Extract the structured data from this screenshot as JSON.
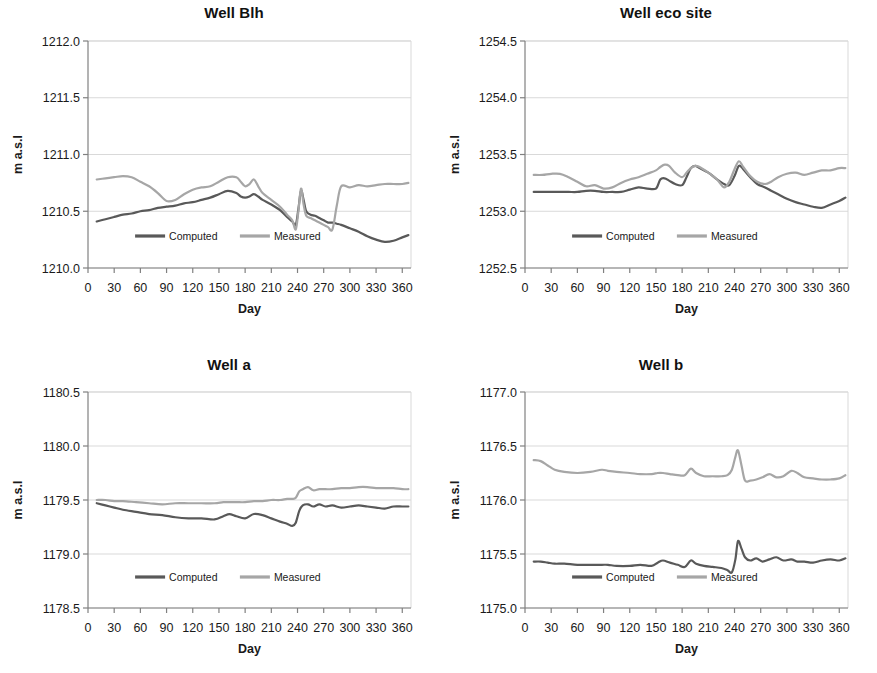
{
  "figure": {
    "panel_count": 4,
    "layout": "2x2"
  },
  "colors": {
    "computed": "#595959",
    "measured": "#a6a6a6",
    "axis": "#808080",
    "gridline": "#d9d9d9",
    "text": "#1a1a1a",
    "background": "#ffffff"
  },
  "common": {
    "xlabel": "Day",
    "ylabel": "m  a.s.l",
    "xticks": [
      "0",
      "30",
      "60",
      "90",
      "120",
      "150",
      "180",
      "210",
      "240",
      "270",
      "300",
      "330",
      "360"
    ],
    "legend": [
      {
        "label": "Computed",
        "color": "#595959"
      },
      {
        "label": "Measured",
        "color": "#a6a6a6"
      }
    ],
    "legend_position": "inside-bottom-center"
  },
  "chart_data": [
    {
      "id": "well-blh",
      "type": "line",
      "title": "Well Blh",
      "xlabel": "Day",
      "ylabel": "m  a.s.l",
      "xlim": [
        0,
        370
      ],
      "ylim": [
        1210.0,
        1212.0
      ],
      "yticks": [
        "1210.0",
        "1210.5",
        "1211.0",
        "1211.5",
        "1212.0"
      ],
      "ytick_values": [
        1210.0,
        1210.5,
        1211.0,
        1211.5,
        1212.0
      ],
      "xticks": [
        "0",
        "30",
        "60",
        "90",
        "120",
        "150",
        "180",
        "210",
        "240",
        "270",
        "300",
        "330",
        "360"
      ],
      "grid": true,
      "x": [
        10,
        20,
        30,
        40,
        50,
        60,
        70,
        80,
        90,
        100,
        110,
        120,
        130,
        140,
        150,
        160,
        170,
        175,
        180,
        185,
        190,
        195,
        200,
        210,
        220,
        228,
        234,
        238,
        241,
        244,
        247,
        250,
        255,
        260,
        265,
        270,
        275,
        280,
        285,
        290,
        300,
        310,
        320,
        330,
        340,
        350,
        360,
        367
      ],
      "series": [
        {
          "name": "Computed",
          "color": "#595959",
          "values": [
            1210.41,
            1210.43,
            1210.45,
            1210.47,
            1210.48,
            1210.5,
            1210.51,
            1210.53,
            1210.54,
            1210.55,
            1210.57,
            1210.58,
            1210.6,
            1210.62,
            1210.65,
            1210.68,
            1210.66,
            1210.63,
            1210.62,
            1210.63,
            1210.65,
            1210.63,
            1210.6,
            1210.56,
            1210.51,
            1210.45,
            1210.41,
            1210.38,
            1210.52,
            1210.68,
            1210.6,
            1210.5,
            1210.47,
            1210.46,
            1210.44,
            1210.42,
            1210.4,
            1210.4,
            1210.39,
            1210.38,
            1210.35,
            1210.32,
            1210.28,
            1210.25,
            1210.23,
            1210.24,
            1210.27,
            1210.29
          ]
        },
        {
          "name": "Measured",
          "color": "#a6a6a6",
          "values": [
            1210.78,
            1210.79,
            1210.8,
            1210.81,
            1210.8,
            1210.76,
            1210.72,
            1210.66,
            1210.59,
            1210.6,
            1210.65,
            1210.69,
            1210.71,
            1210.72,
            1210.76,
            1210.8,
            1210.8,
            1210.76,
            1210.72,
            1210.74,
            1210.78,
            1210.72,
            1210.66,
            1210.6,
            1210.54,
            1210.47,
            1210.42,
            1210.34,
            1210.5,
            1210.7,
            1210.56,
            1210.46,
            1210.44,
            1210.42,
            1210.4,
            1210.38,
            1210.36,
            1210.34,
            1210.55,
            1210.72,
            1210.71,
            1210.73,
            1210.72,
            1210.73,
            1210.74,
            1210.74,
            1210.74,
            1210.75
          ]
        }
      ]
    },
    {
      "id": "well-eco-site",
      "type": "line",
      "title": "Well eco site",
      "xlabel": "Day",
      "ylabel": "m  a.s.l",
      "xlim": [
        0,
        370
      ],
      "ylim": [
        1252.5,
        1254.5
      ],
      "yticks": [
        "1252.5",
        "1253.0",
        "1253.5",
        "1254.0",
        "1254.5"
      ],
      "ytick_values": [
        1252.5,
        1253.0,
        1253.5,
        1254.0,
        1254.5
      ],
      "xticks": [
        "0",
        "30",
        "60",
        "90",
        "120",
        "150",
        "180",
        "210",
        "240",
        "270",
        "300",
        "330",
        "360"
      ],
      "grid": true,
      "x": [
        10,
        20,
        30,
        40,
        50,
        60,
        70,
        80,
        90,
        100,
        110,
        120,
        130,
        140,
        150,
        155,
        160,
        165,
        172,
        180,
        185,
        190,
        195,
        200,
        210,
        220,
        228,
        234,
        240,
        245,
        250,
        258,
        266,
        275,
        282,
        290,
        300,
        310,
        320,
        330,
        340,
        350,
        360,
        367
      ],
      "series": [
        {
          "name": "Computed",
          "color": "#595959",
          "values": [
            1253.17,
            1253.17,
            1253.17,
            1253.17,
            1253.17,
            1253.17,
            1253.18,
            1253.18,
            1253.17,
            1253.17,
            1253.17,
            1253.19,
            1253.21,
            1253.2,
            1253.2,
            1253.28,
            1253.29,
            1253.27,
            1253.24,
            1253.23,
            1253.3,
            1253.38,
            1253.4,
            1253.38,
            1253.34,
            1253.28,
            1253.24,
            1253.23,
            1253.31,
            1253.4,
            1253.37,
            1253.3,
            1253.24,
            1253.21,
            1253.18,
            1253.15,
            1253.11,
            1253.08,
            1253.06,
            1253.04,
            1253.03,
            1253.06,
            1253.09,
            1253.12
          ]
        },
        {
          "name": "Measured",
          "color": "#a6a6a6",
          "values": [
            1253.32,
            1253.32,
            1253.33,
            1253.33,
            1253.3,
            1253.26,
            1253.22,
            1253.23,
            1253.2,
            1253.21,
            1253.25,
            1253.28,
            1253.3,
            1253.33,
            1253.36,
            1253.39,
            1253.41,
            1253.4,
            1253.34,
            1253.3,
            1253.34,
            1253.38,
            1253.4,
            1253.39,
            1253.34,
            1253.28,
            1253.21,
            1253.26,
            1253.37,
            1253.44,
            1253.39,
            1253.31,
            1253.26,
            1253.24,
            1253.26,
            1253.3,
            1253.33,
            1253.34,
            1253.32,
            1253.34,
            1253.36,
            1253.36,
            1253.38,
            1253.38
          ]
        }
      ]
    },
    {
      "id": "well-a",
      "type": "line",
      "title": "Well a",
      "xlabel": "Day",
      "ylabel": "m  a.s.l",
      "xlim": [
        0,
        370
      ],
      "ylim": [
        1178.5,
        1180.5
      ],
      "yticks": [
        "1178.5",
        "1179.0",
        "1179.5",
        "1180.0",
        "1180.5"
      ],
      "ytick_values": [
        1178.5,
        1179.0,
        1179.5,
        1180.0,
        1180.5
      ],
      "xticks": [
        "0",
        "30",
        "60",
        "90",
        "120",
        "150",
        "180",
        "210",
        "240",
        "270",
        "300",
        "330",
        "360"
      ],
      "grid": true,
      "x": [
        10,
        20,
        30,
        40,
        55,
        70,
        85,
        100,
        115,
        130,
        145,
        155,
        162,
        170,
        180,
        190,
        200,
        210,
        220,
        228,
        234,
        238,
        242,
        246,
        252,
        258,
        265,
        272,
        280,
        290,
        300,
        310,
        320,
        330,
        340,
        350,
        360,
        367
      ],
      "series": [
        {
          "name": "Computed",
          "color": "#595959",
          "values": [
            1179.47,
            1179.45,
            1179.43,
            1179.41,
            1179.39,
            1179.37,
            1179.36,
            1179.34,
            1179.33,
            1179.33,
            1179.32,
            1179.35,
            1179.37,
            1179.35,
            1179.33,
            1179.37,
            1179.36,
            1179.33,
            1179.3,
            1179.28,
            1179.26,
            1179.29,
            1179.4,
            1179.45,
            1179.46,
            1179.44,
            1179.46,
            1179.44,
            1179.45,
            1179.43,
            1179.44,
            1179.45,
            1179.44,
            1179.43,
            1179.42,
            1179.44,
            1179.44,
            1179.44
          ]
        },
        {
          "name": "Measured",
          "color": "#a6a6a6",
          "values": [
            1179.5,
            1179.5,
            1179.49,
            1179.49,
            1179.48,
            1179.47,
            1179.46,
            1179.47,
            1179.47,
            1179.47,
            1179.47,
            1179.48,
            1179.48,
            1179.48,
            1179.48,
            1179.49,
            1179.49,
            1179.5,
            1179.5,
            1179.51,
            1179.51,
            1179.52,
            1179.58,
            1179.6,
            1179.62,
            1179.59,
            1179.6,
            1179.6,
            1179.6,
            1179.61,
            1179.61,
            1179.62,
            1179.62,
            1179.61,
            1179.61,
            1179.61,
            1179.6,
            1179.6
          ]
        }
      ]
    },
    {
      "id": "well-b",
      "type": "line",
      "title": "Well b",
      "xlabel": "Day",
      "ylabel": "m a.s.l",
      "xlim": [
        0,
        370
      ],
      "ylim": [
        1175.0,
        1177.0
      ],
      "yticks": [
        "1175.0",
        "1175.5",
        "1176.0",
        "1176.5",
        "1177.0"
      ],
      "ytick_values": [
        1175.0,
        1175.5,
        1176.0,
        1176.5,
        1177.0
      ],
      "xticks": [
        "0",
        "30",
        "60",
        "90",
        "120",
        "150",
        "180",
        "210",
        "240",
        "270",
        "300",
        "330",
        "360"
      ],
      "grid": true,
      "x": [
        10,
        18,
        26,
        34,
        45,
        60,
        75,
        88,
        95,
        105,
        120,
        132,
        145,
        152,
        158,
        166,
        175,
        183,
        190,
        196,
        205,
        215,
        225,
        232,
        237,
        241,
        244,
        248,
        252,
        258,
        265,
        272,
        280,
        288,
        296,
        305,
        312,
        320,
        330,
        340,
        350,
        360,
        367
      ],
      "series": [
        {
          "name": "Computed",
          "color": "#595959",
          "values": [
            1175.43,
            1175.43,
            1175.42,
            1175.41,
            1175.41,
            1175.4,
            1175.4,
            1175.4,
            1175.4,
            1175.39,
            1175.39,
            1175.4,
            1175.39,
            1175.42,
            1175.44,
            1175.42,
            1175.4,
            1175.38,
            1175.44,
            1175.41,
            1175.39,
            1175.38,
            1175.37,
            1175.35,
            1175.33,
            1175.45,
            1175.62,
            1175.55,
            1175.47,
            1175.44,
            1175.46,
            1175.43,
            1175.45,
            1175.47,
            1175.44,
            1175.45,
            1175.43,
            1175.43,
            1175.42,
            1175.44,
            1175.45,
            1175.44,
            1175.46
          ]
        },
        {
          "name": "Measured",
          "color": "#a6a6a6",
          "values": [
            1176.37,
            1176.36,
            1176.32,
            1176.28,
            1176.26,
            1176.25,
            1176.26,
            1176.28,
            1176.27,
            1176.26,
            1176.25,
            1176.24,
            1176.24,
            1176.25,
            1176.25,
            1176.24,
            1176.23,
            1176.23,
            1176.29,
            1176.25,
            1176.22,
            1176.22,
            1176.22,
            1176.23,
            1176.28,
            1176.4,
            1176.46,
            1176.32,
            1176.18,
            1176.18,
            1176.19,
            1176.21,
            1176.24,
            1176.21,
            1176.22,
            1176.27,
            1176.25,
            1176.21,
            1176.2,
            1176.19,
            1176.19,
            1176.2,
            1176.23
          ]
        }
      ]
    }
  ]
}
